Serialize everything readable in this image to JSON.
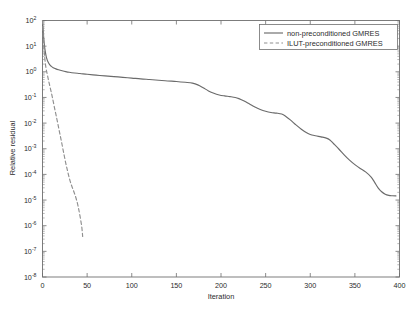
{
  "chart_data": {
    "type": "line",
    "title": "",
    "xlabel": "Iteration",
    "ylabel": "Relative residual",
    "xlim": [
      0,
      400
    ],
    "ylim": [
      1e-08,
      100
    ],
    "yscale": "log",
    "xscale": "linear",
    "grid": false,
    "legend_position": "top-right",
    "xticks": [
      0,
      50,
      100,
      150,
      200,
      250,
      300,
      350,
      400
    ],
    "xtick_labels": [
      "0",
      "50",
      "100",
      "150",
      "200",
      "250",
      "300",
      "350",
      "400"
    ],
    "yticks": [
      100,
      10,
      1,
      0.1,
      0.01,
      0.001,
      0.0001,
      1e-05,
      1e-06,
      1e-07,
      1e-08
    ],
    "ytick_labels": [
      "10^2",
      "10^1",
      "10^0",
      "10^-1",
      "10^-2",
      "10^-3",
      "10^-4",
      "10^-5",
      "10^-6",
      "10^-7",
      "10^-8"
    ],
    "ytick_mantissa": [
      "10",
      "10",
      "10",
      "10",
      "10",
      "10",
      "10",
      "10",
      "10",
      "10",
      "10"
    ],
    "ytick_exponents": [
      "2",
      "1",
      "0",
      "-1",
      "-2",
      "-3",
      "-4",
      "-5",
      "-6",
      "-7",
      "-8"
    ],
    "series": [
      {
        "name": "non-preconditioned GMRES",
        "style": "solid",
        "color": "#6b6b6b",
        "x": [
          0,
          1,
          2,
          3,
          4,
          5,
          6,
          8,
          10,
          12,
          15,
          18,
          22,
          26,
          30,
          36,
          42,
          50,
          60,
          70,
          80,
          90,
          100,
          110,
          120,
          130,
          140,
          150,
          160,
          168,
          174,
          180,
          186,
          192,
          198,
          204,
          210,
          216,
          220,
          226,
          232,
          238,
          244,
          250,
          256,
          262,
          268,
          272,
          278,
          284,
          290,
          296,
          300,
          306,
          312,
          318,
          322,
          326,
          332,
          338,
          344,
          350,
          356,
          362,
          368,
          372,
          376,
          380,
          384,
          388,
          392,
          396
        ],
        "y": [
          100,
          30,
          12,
          6.5,
          4.2,
          3.1,
          2.5,
          1.9,
          1.62,
          1.45,
          1.3,
          1.2,
          1.1,
          1.02,
          0.96,
          0.9,
          0.86,
          0.8,
          0.74,
          0.69,
          0.65,
          0.61,
          0.57,
          0.53,
          0.5,
          0.47,
          0.44,
          0.42,
          0.39,
          0.36,
          0.31,
          0.24,
          0.18,
          0.145,
          0.125,
          0.115,
          0.108,
          0.1,
          0.09,
          0.072,
          0.055,
          0.042,
          0.034,
          0.029,
          0.026,
          0.0245,
          0.0225,
          0.019,
          0.013,
          0.0085,
          0.0058,
          0.0042,
          0.0036,
          0.0032,
          0.0029,
          0.0026,
          0.0022,
          0.0016,
          0.00098,
          0.00058,
          0.00036,
          0.00024,
          0.00017,
          0.000125,
          8e-05,
          5e-05,
          3e-05,
          2.1e-05,
          1.68e-05,
          1.52e-05,
          1.47e-05,
          1.45e-05
        ]
      },
      {
        "name": "ILUT-preconditioned GMRES",
        "style": "dashed",
        "color": "#8f8f8f",
        "x": [
          0,
          1,
          2,
          3,
          4,
          5,
          6,
          7,
          8,
          10,
          12,
          14,
          16,
          18,
          20,
          22,
          24,
          26,
          28,
          30,
          32,
          34,
          36,
          38,
          40,
          42,
          44,
          45
        ],
        "y": [
          100,
          22,
          6.0,
          2.4,
          1.35,
          0.9,
          0.62,
          0.42,
          0.3,
          0.15,
          0.07,
          0.032,
          0.015,
          0.0068,
          0.0031,
          0.0014,
          0.00062,
          0.00028,
          0.00014,
          7.2e-05,
          4.2e-05,
          2.7e-05,
          1.75e-05,
          1.05e-05,
          5.5e-06,
          2.4e-06,
          9e-07,
          3.8e-07
        ]
      }
    ]
  },
  "legend": {
    "entries": [
      {
        "label": "non-preconditioned GMRES",
        "style": "solid"
      },
      {
        "label": "ILUT-preconditioned GMRES",
        "style": "dashed"
      }
    ]
  },
  "axes": {
    "x_title": "Iteration",
    "y_title": "Relative residual"
  }
}
